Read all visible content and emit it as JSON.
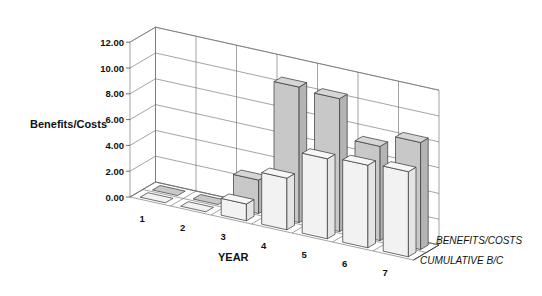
{
  "chart_data": {
    "type": "bar",
    "subtype": "3d-clustered-depth",
    "title": "",
    "xlabel": "YEAR",
    "ylabel": "Benefits/Costs",
    "categories": [
      "1",
      "2",
      "3",
      "4",
      "5",
      "6",
      "7"
    ],
    "yticks": [
      "0.00",
      "2.00",
      "4.00",
      "6.00",
      "8.00",
      "10.00",
      "12.00"
    ],
    "ylim": [
      0,
      12
    ],
    "grid": true,
    "legend_position": "depth-axis-right",
    "series": [
      {
        "name": "BENEFITS/COSTS",
        "values": [
          0,
          0,
          2.6,
          10.5,
          10.3,
          7.3,
          8.3
        ],
        "color": "#c8c8c8"
      },
      {
        "name": "CUMULATIVE B/C",
        "values": [
          0,
          0,
          1.3,
          4.0,
          6.2,
          6.4,
          6.6
        ],
        "color": "#f2f2f2"
      }
    ]
  }
}
